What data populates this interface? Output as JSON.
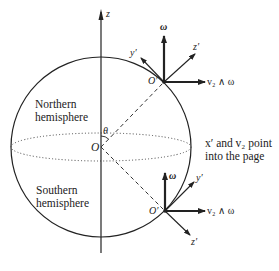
{
  "diagram": {
    "axis_label": "z",
    "center_label": "O",
    "angle_label": "θ",
    "north_label_1": "Northern",
    "north_label_2": "hemisphere",
    "south_label_1": "Southern",
    "south_label_2": "hemisphere",
    "note_1": "x′ and v₂ point",
    "note_2": "into the page",
    "upper_frame": {
      "origin": "O′",
      "omega": "ω",
      "y_axis": "y′",
      "z_axis": "z′",
      "cross": "v₂ ∧ ω"
    },
    "lower_frame": {
      "origin": "O′",
      "omega": "ω",
      "y_axis": "y′",
      "z_axis": "z′",
      "cross": "v₂ ∧ ω"
    },
    "colors": {
      "ink": "#222222",
      "background": "#ffffff"
    }
  }
}
